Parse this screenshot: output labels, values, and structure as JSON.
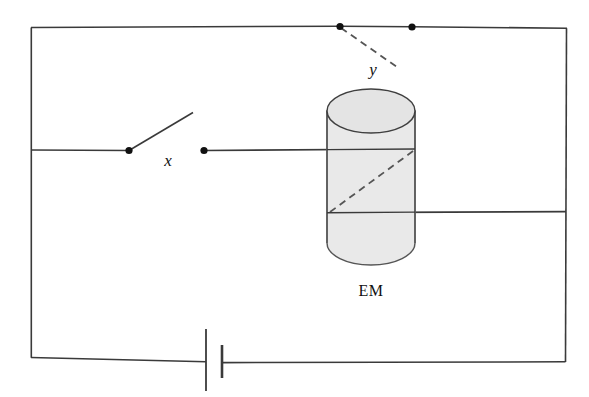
{
  "figure": {
    "type": "circuit-diagram",
    "background_color": "#ffffff",
    "wire_color": "#3a3a3a",
    "terminal_color": "#111111",
    "cylinder_fill": "#e9e9e9",
    "cylinder_stroke": "#555555",
    "dashed_color": "#555555"
  },
  "labels": {
    "switch_x": "x",
    "switch_y": "y",
    "electromagnet": "EM"
  },
  "components": {
    "switch_x": {
      "name": "x",
      "state": "open",
      "left_terminal": {
        "x": 129,
        "y": 150
      },
      "right_terminal": {
        "x": 204,
        "y": 150
      },
      "blade_tip": {
        "x": 193,
        "y": 112
      },
      "label_position": {
        "x": 168,
        "y": 166
      }
    },
    "switch_y": {
      "name": "y",
      "state": "open",
      "left_terminal": {
        "x": 340,
        "y": 27
      },
      "right_terminal": {
        "x": 412,
        "y": 27
      },
      "blade_tip": {
        "x": 396,
        "y": 66
      },
      "blade_style": "dashed",
      "label_position": {
        "x": 373,
        "y": 75
      }
    },
    "electromagnet": {
      "name": "EM",
      "shape": "cylinder",
      "left": 327,
      "right": 415,
      "top": 89,
      "bottom": 265,
      "ellipse_ry": 22,
      "label_position": {
        "x": 371,
        "y": 296
      },
      "coil_lead_dashed": {
        "x1": 330,
        "y1": 212,
        "x2": 415,
        "y2": 150
      }
    },
    "battery": {
      "long_plate": {
        "x": 206,
        "y_top": 329,
        "y_bottom": 391
      },
      "short_plate": {
        "x": 222,
        "y_top": 345,
        "y_bottom": 378
      },
      "wire_y": 362
    }
  },
  "outline": {
    "left": 31,
    "right": 566,
    "top": 27,
    "bottom": 362,
    "mid_wire_y": 150,
    "lower_wire_y": 212
  }
}
